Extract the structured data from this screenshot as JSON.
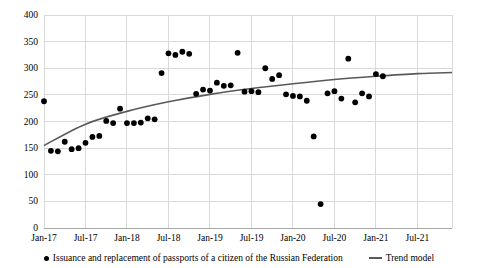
{
  "chart_data": {
    "type": "scatter",
    "title": "",
    "xlabel": "",
    "ylabel": "",
    "ylim": [
      0,
      400
    ],
    "y_ticks": [
      0,
      50,
      100,
      150,
      200,
      250,
      300,
      350,
      400
    ],
    "x_ticks": [
      "Jan-17",
      "Jul-17",
      "Jan-18",
      "Jul-18",
      "Jan-19",
      "Jul-19",
      "Jan-20",
      "Jul-20",
      "Jan-21",
      "Jul-21"
    ],
    "x_range": [
      "Jan-17",
      "Dec-21"
    ],
    "grid": true,
    "legend_position": "bottom",
    "series": [
      {
        "name": "Issuance and replacement of passports of a citizen of the Russian Federation",
        "type": "scatter",
        "marker": "circle",
        "color": "#000000",
        "x": [
          "Jan-17",
          "Feb-17",
          "Mar-17",
          "Apr-17",
          "May-17",
          "Jun-17",
          "Jul-17",
          "Aug-17",
          "Sep-17",
          "Oct-17",
          "Nov-17",
          "Dec-17",
          "Jan-18",
          "Feb-18",
          "Mar-18",
          "Apr-18",
          "May-18",
          "Jun-18",
          "Jul-18",
          "Aug-18",
          "Sep-18",
          "Oct-18",
          "Nov-18",
          "Dec-18",
          "Jan-19",
          "Feb-19",
          "Mar-19",
          "Apr-19",
          "May-19",
          "Jun-19",
          "Jul-19",
          "Aug-19",
          "Sep-19",
          "Oct-19",
          "Nov-19",
          "Dec-19",
          "Jan-20",
          "Feb-20",
          "Mar-20",
          "Apr-20",
          "May-20",
          "Jun-20",
          "Jul-20",
          "Aug-20",
          "Sep-20",
          "Oct-20",
          "Nov-20",
          "Dec-20",
          "Jan-21",
          "Feb-21"
        ],
        "values": [
          238,
          145,
          144,
          162,
          148,
          150,
          160,
          171,
          173,
          201,
          197,
          224,
          197,
          197,
          198,
          206,
          204,
          291,
          328,
          325,
          331,
          327,
          252,
          260,
          258,
          273,
          267,
          268,
          329,
          256,
          257,
          255,
          300,
          280,
          287,
          251,
          248,
          247,
          239,
          172,
          45,
          253,
          257,
          243,
          318,
          236,
          253,
          247,
          289,
          285
        ]
      },
      {
        "name": "Trend model",
        "type": "line",
        "color": "#595959",
        "x": [
          "Jan-17",
          "Jul-17",
          "Jan-18",
          "Jul-18",
          "Jan-19",
          "Jul-19",
          "Jan-20",
          "Jul-20",
          "Jan-21",
          "Jul-21",
          "Dec-21"
        ],
        "values": [
          155,
          195,
          219,
          237,
          251,
          262,
          271,
          279,
          285,
          290,
          292
        ]
      }
    ]
  },
  "axis": {
    "y_labels": [
      "400",
      "350",
      "300",
      "250",
      "200",
      "150",
      "100",
      "50",
      "0"
    ],
    "x_labels": [
      "Jan-17",
      "Jul-17",
      "Jan-18",
      "Jul-18",
      "Jan-19",
      "Jul-19",
      "Jan-20",
      "Jul-20",
      "Jan-21",
      "Jul-21"
    ]
  },
  "legend": {
    "series_label": "Issuance and replacement of passports of a citizen of the Russian Federation",
    "trend_label": "Trend model"
  },
  "colors": {
    "marker": "#000000",
    "trend_line": "#595959",
    "gridline": "#d9d9d9",
    "axis_line": "#a6a6a6",
    "background": "#ffffff"
  }
}
